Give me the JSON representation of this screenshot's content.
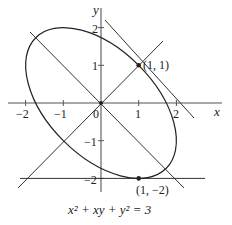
{
  "diagram": {
    "equation": "x² + xy + y² = 3",
    "axes": {
      "x_label": "x",
      "y_label": "y",
      "x_ticks": [
        "−2",
        "−1",
        "0",
        "1",
        "2"
      ],
      "y_ticks": [
        "2",
        "1",
        "−1",
        "−2"
      ]
    },
    "points": [
      {
        "label": "(1, 1)",
        "x": 1,
        "y": 1
      },
      {
        "label": "(1, −2)",
        "x": 1,
        "y": -2
      }
    ],
    "lines": [
      {
        "name": "y = x",
        "description": "line through origin with slope 1"
      },
      {
        "name": "y = −x",
        "description": "line through origin with slope −1"
      },
      {
        "name": "x + y = 2",
        "description": "tangent line at (1, 1)"
      },
      {
        "name": "y = −2",
        "description": "horizontal tangent line at (1, −2)"
      }
    ],
    "colors": {
      "ink": "#222222",
      "background": "#ffffff"
    }
  }
}
